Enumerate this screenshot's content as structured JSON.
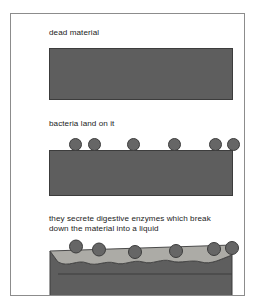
{
  "figure": {
    "frame": {
      "border_color": "#8c8c8c",
      "background_color": "#ffffff"
    },
    "colors": {
      "solid_material": "#5e5e5e",
      "material_outline": "#3c3c3c",
      "bacterium_fill": "#666666",
      "bacterium_outline": "#3c3c3c",
      "liquid": "#a8a6a1",
      "liquid_outline": "#4a4a4a",
      "text": "#1b1b1b"
    }
  },
  "panels": [
    {
      "id": "panel-1",
      "caption": "dead material",
      "block_label": "dead material block",
      "bacteria_count": 0
    },
    {
      "id": "panel-2",
      "caption": "bacteria land on it",
      "block_label": "dead material block with bacteria",
      "bacteria_count": 6,
      "bacteria_x": [
        20,
        39,
        78,
        119,
        160,
        178
      ]
    },
    {
      "id": "panel-3",
      "caption": "they secrete digestive enzymes which break\ndown the material into a liquid",
      "block_label": "partly digested material with liquid layer",
      "bacteria_count": 6,
      "bacteria_x": [
        20,
        43,
        79,
        120,
        158,
        177
      ]
    }
  ],
  "panel_3_shapes": {
    "liquid_layer_name": "liquid layer",
    "eroded_surface_name": "eroded material surface",
    "solid_remainder_name": "remaining solid material"
  }
}
